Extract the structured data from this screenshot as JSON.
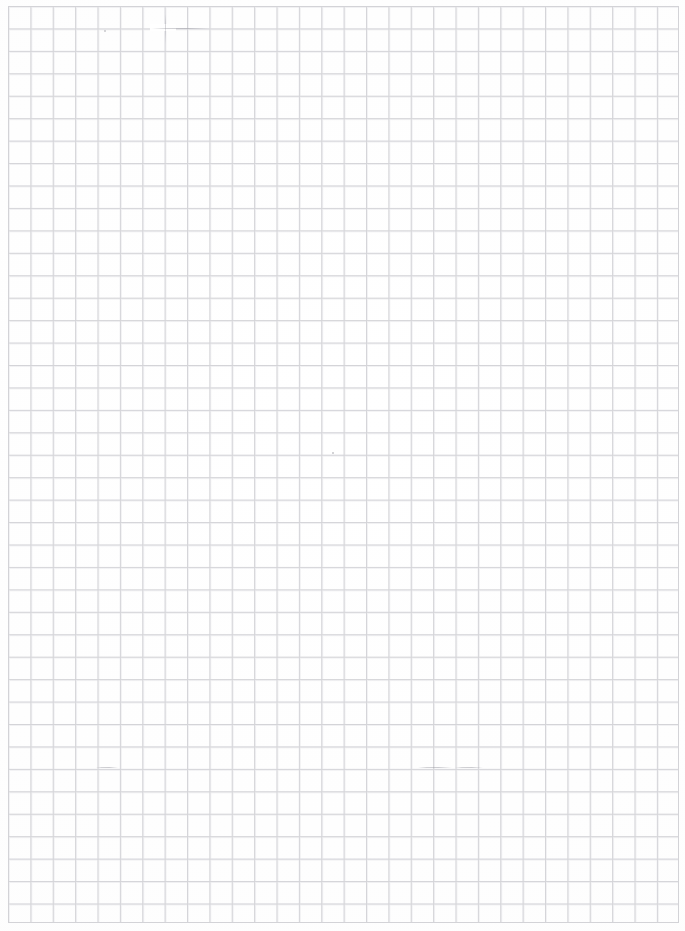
{
  "document": {
    "kind": "scanned-grid-paper",
    "title": "Blank grid paper scan",
    "page_label": "",
    "text_content": "",
    "notes": "No printed or handwritten text is present anywhere on the sheet."
  },
  "canvas": {
    "width_px": 685,
    "height_px": 931,
    "background_color": "#ffffff",
    "paper_tone_color": "#fefefe"
  },
  "grid": {
    "type": "square-grid",
    "line_color": "#d3d3d7",
    "line_color_soft": "#e6e6ea",
    "line_width_px": 0.9,
    "cell_width_px": 22.38,
    "cell_height_px": 22.44,
    "columns": 30,
    "rows": 41,
    "origin_x_px": 8,
    "origin_y_px": 5.5,
    "block_width_px": 671,
    "block_height_px": 917
  },
  "margins": {
    "left_px": 8,
    "top_px": 5.5,
    "right_px": 6.5,
    "bottom_px": 9.5,
    "margin_color": "#ffffff"
  },
  "artifacts": [
    {
      "name": "smudge-top-horizontal",
      "x": 152,
      "y": 27.5,
      "width": 58,
      "height": 1.2
    },
    {
      "name": "smudge-top-gap",
      "x": 150,
      "y": 24,
      "width": 26,
      "height": 7
    },
    {
      "name": "stroke-top-vertical",
      "x": 164.5,
      "y": 14,
      "width": 1.2,
      "height": 30
    },
    {
      "name": "smudge-lower-horizontal-a",
      "x": 418,
      "y": 766.5,
      "width": 34,
      "height": 1.2
    },
    {
      "name": "smudge-lower-horizontal-b",
      "x": 455,
      "y": 766.5,
      "width": 28,
      "height": 1.2
    },
    {
      "name": "smudge-mid-left",
      "x": 96,
      "y": 766.5,
      "width": 22,
      "height": 1.2
    },
    {
      "name": "speck-upper-left",
      "x": 104,
      "y": 30,
      "width": 2,
      "height": 2
    },
    {
      "name": "speck-mid",
      "x": 332,
      "y": 452,
      "width": 1.6,
      "height": 1.6
    }
  ]
}
